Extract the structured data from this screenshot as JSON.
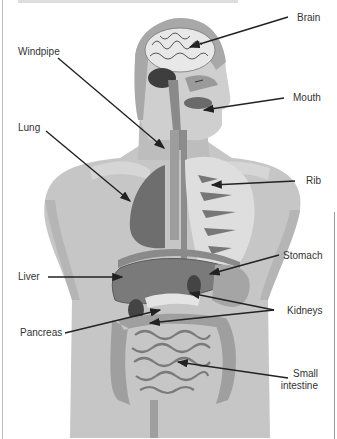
{
  "diagram": {
    "type": "anatomy-labeled-figure",
    "colors": {
      "background": "#ffffff",
      "body": "#c8c8c8",
      "body_dark": "#a9a9a9",
      "organ": "#6f6f6f",
      "organ_dark": "#4a4a4a",
      "brain": "#e6e6e6",
      "arrow": "#222222",
      "label_text": "#333333"
    },
    "labels": [
      {
        "id": "brain",
        "text": "Brain",
        "side": "right"
      },
      {
        "id": "windpipe",
        "text": "Windpipe",
        "side": "left"
      },
      {
        "id": "mouth",
        "text": "Mouth",
        "side": "right"
      },
      {
        "id": "lung",
        "text": "Lung",
        "side": "left"
      },
      {
        "id": "rib",
        "text": "Rib",
        "side": "right"
      },
      {
        "id": "stomach",
        "text": "Stomach",
        "side": "right"
      },
      {
        "id": "liver",
        "text": "Liver",
        "side": "left"
      },
      {
        "id": "kidneys",
        "text": "Kidneys",
        "side": "right"
      },
      {
        "id": "pancreas",
        "text": "Pancreas",
        "side": "left"
      },
      {
        "id": "small_intestine",
        "text": "Small intestine",
        "line1": "Small",
        "line2": "intestine",
        "side": "right"
      }
    ]
  }
}
